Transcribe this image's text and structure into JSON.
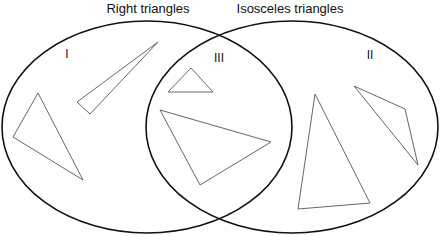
{
  "diagram": {
    "type": "venn",
    "sets": [
      {
        "id": "left",
        "title": "Right triangles"
      },
      {
        "id": "right",
        "title": "Isosceles triangles"
      }
    ],
    "regions": [
      {
        "id": "I",
        "label": "I",
        "description": "right only",
        "triangle_count": 2
      },
      {
        "id": "II",
        "label": "II",
        "description": "isosceles only",
        "triangle_count": 2
      },
      {
        "id": "III",
        "label": "III",
        "description": "both right and isosceles",
        "triangle_count": 2
      }
    ],
    "colors": {
      "outline": "#111111",
      "triangle_stroke": "#555555",
      "background": "#ffffff"
    }
  }
}
